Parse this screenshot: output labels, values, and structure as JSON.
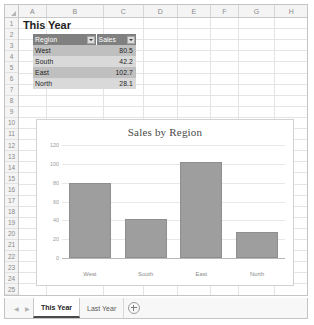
{
  "grid": {
    "columns": [
      "A",
      "B",
      "C",
      "D",
      "E",
      "F",
      "G",
      "H"
    ],
    "rows": [
      "1",
      "2",
      "3",
      "4",
      "5",
      "6",
      "7",
      "8",
      "9",
      "10",
      "11",
      "12",
      "13",
      "14",
      "15",
      "16",
      "17",
      "18",
      "19",
      "20",
      "21",
      "22",
      "23",
      "24",
      "25"
    ],
    "select_all_icon": "select-all-triangle-icon"
  },
  "sheet": {
    "title_cell": "This Year"
  },
  "table": {
    "headers": [
      "Region",
      "Sales"
    ],
    "filter_icon": "filter-dropdown-icon",
    "rows": [
      {
        "region": "West",
        "sales": "80.5"
      },
      {
        "region": "South",
        "sales": "42.2"
      },
      {
        "region": "East",
        "sales": "102.7"
      },
      {
        "region": "North",
        "sales": "28.1"
      }
    ]
  },
  "chart_data": {
    "type": "bar",
    "title": "Sales by Region",
    "categories": [
      "West",
      "South",
      "East",
      "North"
    ],
    "values": [
      80.5,
      42.2,
      102.7,
      28.1
    ],
    "series": [
      {
        "name": "Sales",
        "values": [
          80.5,
          42.2,
          102.7,
          28.1
        ]
      }
    ],
    "xlabel": "",
    "ylabel": "",
    "ylim": [
      0,
      120
    ],
    "yticks": [
      "0",
      "20",
      "40",
      "60",
      "80",
      "100",
      "120"
    ],
    "grid": true,
    "legend": false,
    "bar_color": "#9e9e9e"
  },
  "tabbar": {
    "prev_arrow": "chevron-left-icon",
    "next_arrow": "chevron-right-icon",
    "tabs": [
      {
        "label": "This Year",
        "active": true
      },
      {
        "label": "Last Year",
        "active": false
      }
    ],
    "add_sheet_icon": "plus-circle-icon"
  }
}
